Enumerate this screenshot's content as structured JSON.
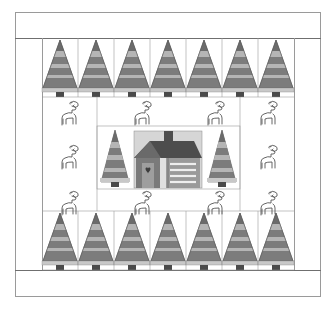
{
  "pattern": {
    "title": "",
    "description": "Christmas quilt layout: tree borders top and bottom, deer blocks around a central cabin panel",
    "colors": {
      "background": "#ffffff",
      "outline": "#6f6f6f",
      "tree_dark": "#6b6b6b",
      "tree_mid": "#8c8c8c",
      "tree_light": "#b5b5b5",
      "trunk": "#4a4a4a",
      "house_roof": "#4d4d4d",
      "house_wall": "#7a7a7a",
      "house_siding": "#9a9a9a",
      "sky": "#d6d6d6",
      "heart": "#3d3d3d"
    },
    "rows": {
      "top_trees": 7,
      "bottom_trees": 7,
      "deer_top_row": 4,
      "deer_bottom_row": 4,
      "deer_side_each": 1,
      "center_trees": 2,
      "center_house": 1
    }
  }
}
